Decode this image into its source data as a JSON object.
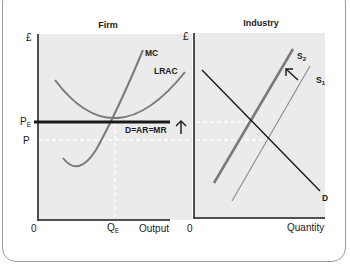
{
  "firm": {
    "title": "Firm",
    "y_axis_label": "£",
    "x_axis_label": "Output",
    "origin_label": "0",
    "price_equilibrium_label": "P",
    "price_equilibrium_sub": "E",
    "price_label": "P",
    "quantity_equilibrium_label": "Q",
    "quantity_equilibrium_sub": "E",
    "curves": {
      "mc": "MC",
      "lrac": "LRAC",
      "demand": "D=AR=MR"
    },
    "arrow": "up"
  },
  "industry": {
    "title": "Industry",
    "y_axis_label": "£",
    "x_axis_label": "Quantity",
    "origin_label": "0",
    "curves": {
      "s2": "S",
      "s2_sub": "2",
      "s1": "S",
      "s1_sub": "1",
      "demand": "D"
    },
    "arrow": "up-left"
  },
  "colors": {
    "panel_bg": "#ebebeb",
    "axis": "#1a1a1a",
    "curve_grey": "#7a7a7a",
    "demand_line": "#1a1a1a",
    "dashed": "#ffffff"
  }
}
